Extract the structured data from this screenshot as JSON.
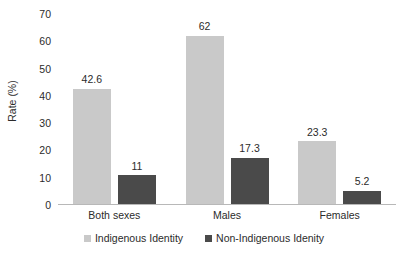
{
  "chart_data": {
    "type": "bar",
    "title": "",
    "xlabel": "",
    "ylabel": "Rate (%)",
    "ylim": [
      0,
      70
    ],
    "ytick_step": 10,
    "yticks": [
      70,
      60,
      50,
      40,
      30,
      20,
      10,
      0
    ],
    "grid": false,
    "legend_position": "bottom",
    "categories": [
      "Both sexes",
      "Males",
      "Females"
    ],
    "series": [
      {
        "name": "Indigenous Identity",
        "color": "#c9c9c9",
        "values": [
          42.6,
          62,
          23.3
        ],
        "labels": [
          "42.6",
          "62",
          "23.3"
        ]
      },
      {
        "name": "Non-Indigenous Idenity",
        "color": "#4a4a4a",
        "values": [
          11,
          17.3,
          5.2
        ],
        "labels": [
          "11",
          "17.3",
          "5.2"
        ]
      }
    ]
  },
  "axis": {
    "y_title": "Rate (%)"
  },
  "legend": {
    "items": [
      {
        "label": "Indigenous Identity"
      },
      {
        "label": "Non-Indigenous Idenity"
      }
    ]
  }
}
